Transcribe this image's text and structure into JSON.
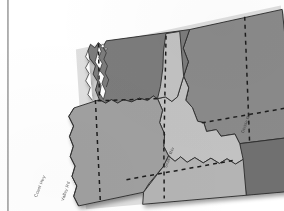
{
  "document": {
    "kind": "scanned-map-figure",
    "caption": "",
    "background_color": "#ffffff",
    "margin_rule_color": "#8e8e8e"
  },
  "map": {
    "title": "",
    "region": "Pacific Northwest, United States",
    "projection_note": "",
    "rotation_degrees": -5,
    "shadow_color": "#c8c8c8",
    "outline_color": "#2e2e2e",
    "water_color": "#ffffff",
    "highway_line_style": "dashed",
    "highway_line_color": "#1f1f1f",
    "states": [
      {
        "name": "Washington",
        "abbr": "WA",
        "fill": "#7c7c7c",
        "label": ""
      },
      {
        "name": "Oregon",
        "abbr": "OR",
        "fill": "#a0a0a0",
        "label": ""
      },
      {
        "name": "Idaho",
        "abbr": "ID",
        "fill": "#c2c2c2",
        "label": ""
      },
      {
        "name": "Montana",
        "abbr": "MT",
        "fill": "#8a8a8a",
        "label": ""
      },
      {
        "name": "Wyoming",
        "abbr": "WY",
        "fill": "#6f6f6f",
        "label": ""
      },
      {
        "name": "Nevada",
        "abbr": "NV",
        "fill": "#b4b4b4",
        "label": ""
      },
      {
        "name": "Utah",
        "abbr": "UT",
        "fill": "#9a9a9a",
        "label": ""
      }
    ],
    "route_labels": [
      {
        "id": "route-label-coast",
        "text": "Coast Hwy",
        "x": 33,
        "y": 196,
        "rotate": -68
      },
      {
        "id": "route-label-valley",
        "text": "Valley Rd",
        "x": 60,
        "y": 200,
        "rotate": -72
      },
      {
        "id": "route-label-snake",
        "text": "Snake Riv",
        "x": 163,
        "y": 167,
        "rotate": -70
      },
      {
        "id": "route-label-divide",
        "text": "Divide Rd",
        "x": 240,
        "y": 132,
        "rotate": -70
      }
    ]
  }
}
